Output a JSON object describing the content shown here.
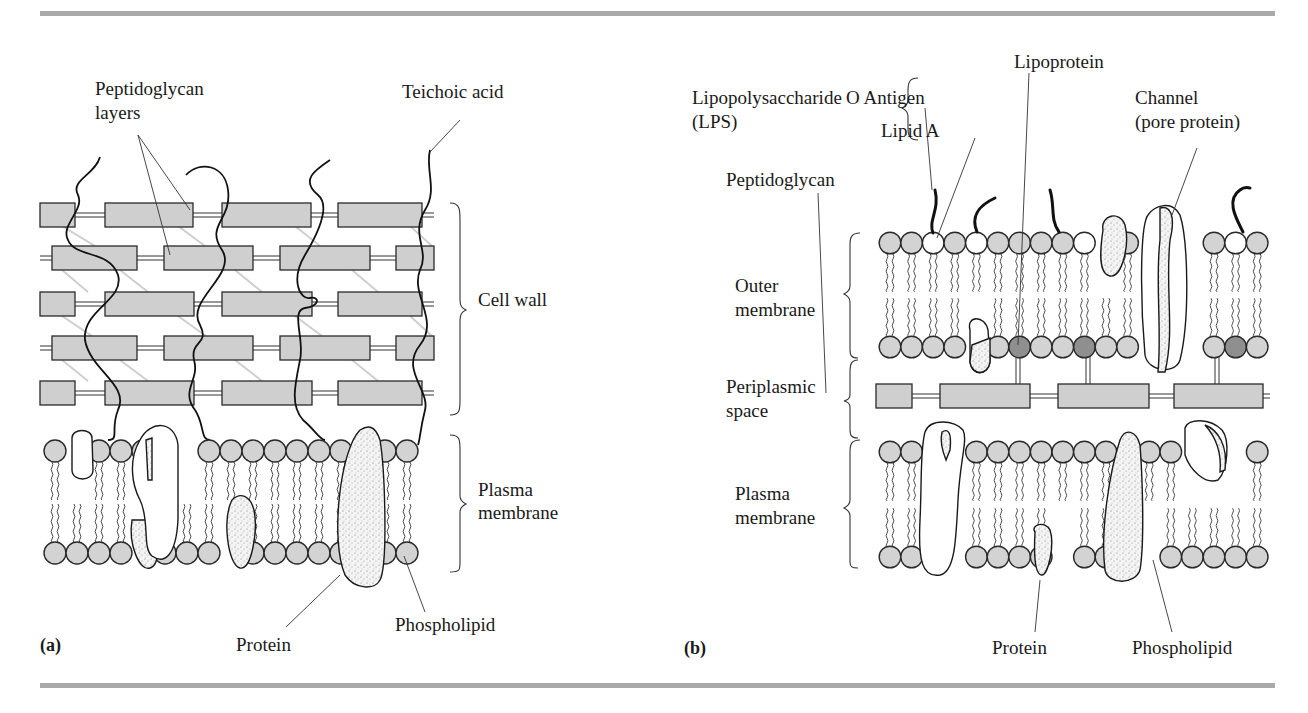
{
  "figure": {
    "type": "diagram",
    "colors": {
      "rule": "#a9a9a9",
      "peptidoglycan_box": "#cfcfcf",
      "phospholipid_head": "#d3d3d3",
      "lipid_a_head": "#ffffff",
      "lipoprotein_head": "#8f8f8f",
      "outline": "#2a2a2a"
    }
  },
  "panel_a": {
    "tag": "(a)",
    "labels": {
      "peptidoglycan_line1": "Peptidoglycan",
      "peptidoglycan_line2": "layers",
      "teichoic_acid": "Teichoic acid",
      "cell_wall": "Cell wall",
      "plasma_line1": "Plasma",
      "plasma_line2": "membrane",
      "protein": "Protein",
      "phospholipid": "Phospholipid"
    }
  },
  "panel_b": {
    "tag": "(b)",
    "labels": {
      "lps_line1": "Lipopolysaccharide",
      "lps_line2": "(LPS)",
      "o_antigen": "O Antigen",
      "lipid_a": "Lipid A",
      "lipoprotein": "Lipoprotein",
      "channel_line1": "Channel",
      "channel_line2": "(pore protein)",
      "peptidoglycan": "Peptidoglycan",
      "outer_line1": "Outer",
      "outer_line2": "membrane",
      "periplasmic_line1": "Periplasmic",
      "periplasmic_line2": "space",
      "plasma_line1": "Plasma",
      "plasma_line2": "membrane",
      "protein": "Protein",
      "phospholipid": "Phospholipid"
    }
  }
}
